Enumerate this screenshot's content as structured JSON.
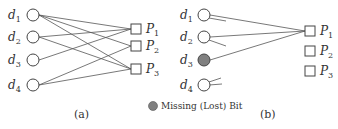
{
  "panels": [
    {
      "caption": "(a)",
      "data_nodes": [
        "d1",
        "d2",
        "d3",
        "d4"
      ],
      "parity_nodes": [
        "P1",
        "P2",
        "P3"
      ],
      "edges": [
        [
          "d1",
          "P1"
        ],
        [
          "d1",
          "P2"
        ],
        [
          "d1",
          "P3"
        ],
        [
          "d2",
          "P1"
        ],
        [
          "d2",
          "P3"
        ],
        [
          "d3",
          "P1"
        ],
        [
          "d4",
          "P2"
        ],
        [
          "d4",
          "P3"
        ]
      ]
    },
    {
      "caption": "(b)",
      "data_nodes": [
        "d1",
        "d2",
        "d3",
        "d4"
      ],
      "parity_nodes": [
        "P1",
        "P2",
        "P3"
      ],
      "missing_node": "d3",
      "edges": [
        [
          "d1",
          "P1"
        ],
        [
          "d2",
          "P1"
        ],
        [
          "d3",
          "P1"
        ]
      ]
    }
  ],
  "legend": {
    "label": "Missing (Lost) Bit",
    "color": "#808080"
  },
  "labels": {
    "d1": "d",
    "d1s": "1",
    "d2": "d",
    "d2s": "2",
    "d3": "d",
    "d3s": "3",
    "d4": "d",
    "d4s": "4",
    "P1": "P",
    "P1s": "1",
    "P2": "P",
    "P2s": "2",
    "P3": "P",
    "P3s": "3",
    "cap_a": "(a)",
    "cap_b": "(b)"
  }
}
